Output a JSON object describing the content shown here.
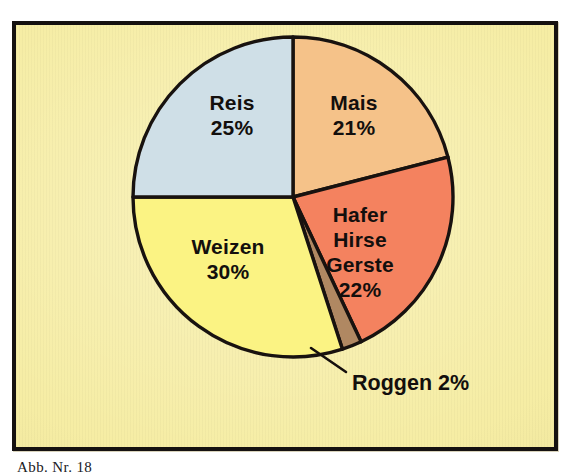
{
  "figure": {
    "caption": "Abb. Nr. 18",
    "frame_border_color": "#151110",
    "plate_background_color": "#f6eda4",
    "page_background_color": "#ffffff",
    "outline_color": "#18120f",
    "text_color": "#130f0d"
  },
  "chart_data": {
    "type": "pie",
    "title": "",
    "subtitle": "",
    "xlabel": "",
    "ylabel": "",
    "grid": false,
    "legend_position": "none",
    "labels_inside_slices": true,
    "start_angle_deg": 0,
    "direction": "clockwise",
    "center": {
      "x": 293,
      "y": 197
    },
    "radius": 160,
    "units": "%",
    "total": 100,
    "categories": [
      "Mais",
      "Hafer Hirse Gerste",
      "Roggen",
      "Weizen",
      "Reis"
    ],
    "values": [
      21,
      22,
      2,
      30,
      25
    ],
    "colors": [
      "#f5c289",
      "#f4825f",
      "#b08862",
      "#fbf383",
      "#cfdfe7"
    ],
    "slices": [
      {
        "name": "Mais",
        "label_lines": [
          "Mais",
          "21%"
        ],
        "value": 21,
        "percent_text": "21%",
        "color": "#f5c289",
        "start_deg": 0,
        "end_deg": 75.6,
        "label_x": 354,
        "label_y": 116
      },
      {
        "name": "Hafer Hirse Gerste",
        "label_lines": [
          "Hafer",
          "Hirse",
          "Gerste",
          "22%"
        ],
        "value": 22,
        "percent_text": "22%",
        "color": "#f4825f",
        "start_deg": 75.6,
        "end_deg": 154.8,
        "label_x": 360,
        "label_y": 253
      },
      {
        "name": "Roggen",
        "label_lines": [
          "Roggen 2%"
        ],
        "value": 2,
        "percent_text": "2%",
        "color": "#b08862",
        "start_deg": 154.8,
        "end_deg": 162,
        "callout": true,
        "label_x": 355,
        "label_y": 383
      },
      {
        "name": "Weizen",
        "label_lines": [
          "Weizen",
          "30%"
        ],
        "value": 30,
        "percent_text": "30%",
        "color": "#fbf383",
        "start_deg": 162,
        "end_deg": 270,
        "label_x": 228,
        "label_y": 260
      },
      {
        "name": "Reis",
        "label_lines": [
          "Reis",
          "25%"
        ],
        "value": 25,
        "percent_text": "25%",
        "color": "#cfdfe7",
        "start_deg": 270,
        "end_deg": 360,
        "label_x": 232,
        "label_y": 116
      }
    ],
    "callout": {
      "label": "Roggen 2%",
      "line_from": {
        "x": 311,
        "y": 348
      },
      "line_to": {
        "x": 346,
        "y": 372
      },
      "label_x": 352,
      "label_y": 384
    }
  }
}
